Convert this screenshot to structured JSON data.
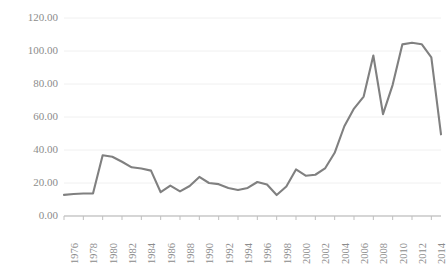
{
  "chart_data": {
    "type": "line",
    "title": "",
    "subtitle": "",
    "xlabel": "",
    "ylabel": "",
    "grid": true,
    "legend_position": "none",
    "line_color": "#808080",
    "axis_color": "#d9d9d9",
    "grid_color": "#f0f0f0",
    "tick_label_color": "#8c8c8c",
    "ylim": [
      0,
      120
    ],
    "ytick_values": [
      0,
      20,
      40,
      60,
      80,
      100,
      120
    ],
    "ytick_labels": [
      "0.00",
      "20.00",
      "40.00",
      "60.00",
      "80.00",
      "100.00",
      "120.00"
    ],
    "xlim": [
      1976,
      2015
    ],
    "xtick_labels": [
      "1976",
      "1978",
      "1980",
      "1982",
      "1984",
      "1986",
      "1988",
      "1990",
      "1992",
      "1994",
      "1996",
      "1998",
      "2000",
      "2002",
      "2004",
      "2006",
      "2008",
      "2010",
      "2012",
      "2014"
    ],
    "x": [
      1976,
      1977,
      1978,
      1979,
      1980,
      1981,
      1982,
      1983,
      1984,
      1985,
      1986,
      1987,
      1988,
      1989,
      1990,
      1991,
      1992,
      1993,
      1994,
      1995,
      1996,
      1997,
      1998,
      1999,
      2000,
      2001,
      2002,
      2003,
      2004,
      2005,
      2006,
      2007,
      2008,
      2009,
      2010,
      2011,
      2012,
      2013,
      2014,
      2015
    ],
    "values": [
      12.8,
      13.3,
      13.6,
      13.6,
      36.8,
      35.9,
      32.9,
      29.5,
      28.8,
      27.5,
      14.4,
      18.4,
      14.9,
      18.2,
      23.7,
      20.0,
      19.3,
      17.0,
      15.8,
      17.0,
      20.6,
      19.1,
      12.7,
      17.9,
      28.2,
      24.4,
      25.0,
      28.8,
      38.3,
      54.4,
      65.1,
      72.4,
      97.3,
      61.7,
      79.5,
      104.0,
      105.0,
      104.1,
      96.2,
      49.5
    ]
  }
}
